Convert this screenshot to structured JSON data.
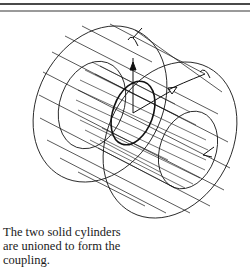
{
  "page": {
    "top_rules": [
      "dark-rule",
      "gray-rule"
    ]
  },
  "figure": {
    "axis_label": "Z",
    "line_color": "#111111",
    "background": "#ffffff"
  },
  "caption": {
    "lines": [
      "The two solid cylinders",
      "are unioned to form the",
      "coupling."
    ]
  }
}
